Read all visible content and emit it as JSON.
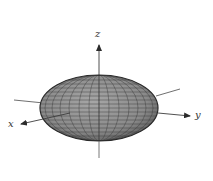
{
  "figure": {
    "axes": {
      "x_label": "x",
      "y_label": "y",
      "z_label": "z"
    },
    "surface": {
      "shape": "ellipsoid",
      "fill_color": "#8e8e8e",
      "rim_color": "#2a2a2a",
      "grid_color": "#3a3a3a",
      "meridians": 12,
      "parallels": 14
    },
    "colors": {
      "background": "#ffffff",
      "axis_line": "#3c3c3c"
    }
  }
}
